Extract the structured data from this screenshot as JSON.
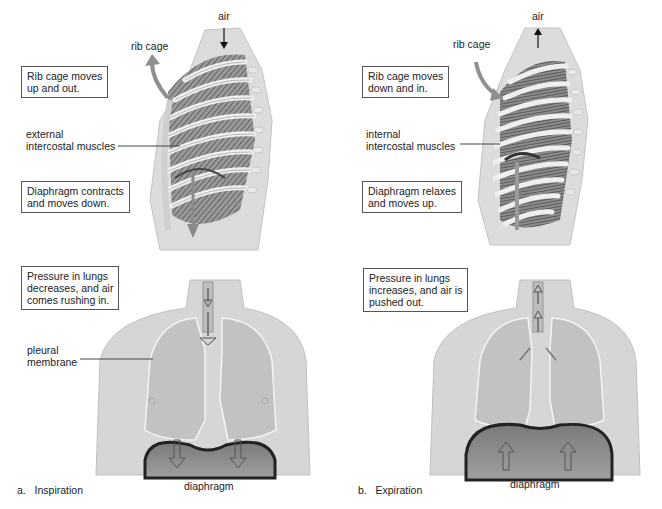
{
  "panels": [
    {
      "id": "a",
      "caption_letter": "a.",
      "caption": "Inspiration",
      "side_view": {
        "air_label": "air",
        "air_direction": "in",
        "rib_cage_label": "rib cage",
        "rib_cage_box": [
          "Rib cage moves",
          "up and out."
        ],
        "muscle_label": [
          "external",
          "intercostal muscles"
        ],
        "diaphragm_box": [
          "Diaphragm contracts",
          "and moves down."
        ]
      },
      "front_view": {
        "pressure_box": [
          "Pressure in lungs",
          "decreases, and air",
          "comes rushing in."
        ],
        "pleural_label": [
          "pleural",
          "membrane"
        ],
        "diaphragm_label": "diaphragm"
      }
    },
    {
      "id": "b",
      "caption_letter": "b.",
      "caption": "Expiration",
      "side_view": {
        "air_label": "air",
        "air_direction": "out",
        "rib_cage_label": "rib cage",
        "rib_cage_box": [
          "Rib cage moves",
          "down and in."
        ],
        "muscle_label": [
          "internal",
          "intercostal muscles"
        ],
        "diaphragm_box": [
          "Diaphragm relaxes",
          "and moves up."
        ]
      },
      "front_view": {
        "pressure_box": [
          "Pressure in lungs",
          "increases, and air is",
          "pushed out."
        ],
        "diaphragm_label": "diaphragm"
      }
    }
  ],
  "colors": {
    "body": "#d9d9d9",
    "body_edge": "#bdbdbd",
    "lung": "#c4c4c4",
    "diaphragm_fill": "#8a8a8a",
    "diaphragm_edge": "#2a2a2a",
    "rib": "#e6e6e6",
    "muscle": "#6e6e6e",
    "arrow": "#9a9a9a"
  }
}
